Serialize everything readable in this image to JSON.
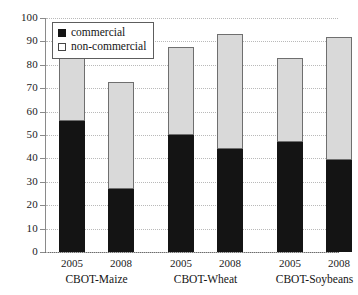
{
  "chart_data": {
    "type": "bar",
    "subtype": "stacked-vertical",
    "title": "",
    "xlabel": "",
    "ylabel": "",
    "ylim": [
      0,
      100
    ],
    "yticks": [
      0,
      10,
      20,
      30,
      40,
      50,
      60,
      70,
      80,
      90,
      100
    ],
    "ytick_labels": [
      "0",
      "10",
      "20",
      "30",
      "40",
      "50",
      "60",
      "70",
      "80",
      "90",
      "100"
    ],
    "grid": true,
    "grid_axis": "y",
    "legend_position": "upper-left",
    "categories": [
      "2005",
      "2008",
      "2005",
      "2008",
      "2005",
      "2008"
    ],
    "groups": [
      {
        "label": "CBOT-Maize",
        "years": [
          "2005",
          "2008"
        ]
      },
      {
        "label": "CBOT-Wheat",
        "years": [
          "2005",
          "2008"
        ]
      },
      {
        "label": "CBOT-Soybeans",
        "years": [
          "2005",
          "2008"
        ]
      }
    ],
    "series": [
      {
        "name": "commercial",
        "color": "#141414",
        "values": [
          56,
          27,
          50,
          44,
          47,
          39.5
        ]
      },
      {
        "name": "non-commercial",
        "color": "#d9d9d9",
        "values": [
          27,
          45.5,
          37.5,
          49,
          36,
          52.5
        ]
      }
    ],
    "totals": [
      83,
      72.5,
      87.5,
      93,
      83,
      92
    ],
    "bars": [
      {
        "group": "CBOT-Maize",
        "year": "2005",
        "commercial": 56,
        "non_commercial": 27,
        "total": 83
      },
      {
        "group": "CBOT-Maize",
        "year": "2008",
        "commercial": 27,
        "non_commercial": 45.5,
        "total": 72.5
      },
      {
        "group": "CBOT-Wheat",
        "year": "2005",
        "commercial": 50,
        "non_commercial": 37.5,
        "total": 87.5
      },
      {
        "group": "CBOT-Wheat",
        "year": "2008",
        "commercial": 44,
        "non_commercial": 49,
        "total": 93
      },
      {
        "group": "CBOT-Soybeans",
        "year": "2005",
        "commercial": 47,
        "non_commercial": 36,
        "total": 83
      },
      {
        "group": "CBOT-Soybeans",
        "year": "2008",
        "commercial": 39.5,
        "non_commercial": 52.5,
        "total": 92
      }
    ]
  },
  "legend": {
    "items": [
      {
        "label": "commercial",
        "swatch": "filled-square",
        "color": "#141414"
      },
      {
        "label": "non-commercial",
        "swatch": "hollow-square",
        "color": "#ffffff"
      }
    ]
  },
  "axis": {
    "y_labels": [
      "100",
      "90",
      "80",
      "70",
      "60",
      "50",
      "40",
      "30",
      "20",
      "10",
      "0"
    ],
    "x_year_labels": [
      "2005",
      "2008",
      "2005",
      "2008",
      "2005",
      "2008"
    ],
    "x_group_labels": [
      "CBOT-Maize",
      "CBOT-Wheat",
      "CBOT-Soybeans"
    ]
  },
  "colors": {
    "commercial": "#141414",
    "non_commercial": "#d9d9d9",
    "bar_outline": "#6f6f6f",
    "axis": "#6d6d6d",
    "gridline": "#b9b9b9",
    "background": "#ffffff",
    "text": "#151515"
  }
}
